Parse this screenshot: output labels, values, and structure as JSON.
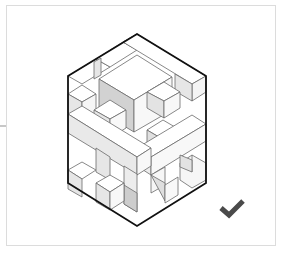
{
  "puzzle": {
    "type": "isometric-cube-structure",
    "status": "correct",
    "status_icon": "checkmark-icon",
    "colors": {
      "outline": "#111111",
      "inner_line": "#6a6a6a",
      "face_top": "#ffffff",
      "face_left": "#e9e9e9",
      "face_right": "#f7f7f7",
      "face_shadow": "#c9c9c9",
      "check": "#4a4a4a",
      "card_border": "#dcdcdc"
    }
  }
}
